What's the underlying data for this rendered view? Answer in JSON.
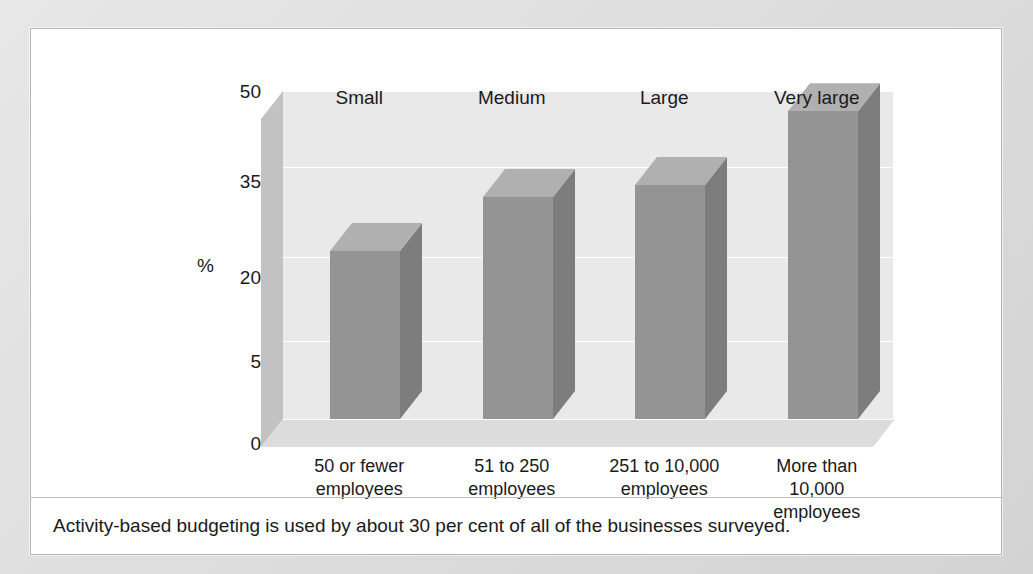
{
  "clipped_top_text": "",
  "chart_data": {
    "type": "bar",
    "title": "",
    "xlabel": "",
    "ylabel": "%",
    "categories": [
      "50 or fewer\nemployees",
      "51 to 250\nemployees",
      "251 to 10,000\nemployees",
      "More than\n10,000\nemployees"
    ],
    "group_labels": [
      "Small",
      "Medium",
      "Large",
      "Very large"
    ],
    "values": [
      21,
      30,
      32,
      46
    ],
    "ytick_labels": [
      "50",
      "35",
      "20",
      "5",
      "0"
    ],
    "ytick_values": [
      50,
      35,
      20,
      5,
      0
    ],
    "ylim": [
      0,
      50
    ],
    "grid": true,
    "legend": "none",
    "style": "3d-column",
    "colors": {
      "bar_front": "#949494",
      "bar_side": "#7d7d7d",
      "bar_top": "#b0b0b0",
      "back_wall": "#e9e9e9",
      "left_wall": "#c2c2c2",
      "floor": "#dcdcdc",
      "panel": "#ffffff",
      "page": "#dadada",
      "text": "#1a1a1a"
    }
  },
  "ticks": [
    {
      "label": "50",
      "top": 52
    },
    {
      "label": "35",
      "top": 142
    },
    {
      "label": "20",
      "top": 238
    },
    {
      "label": "5",
      "top": 322
    },
    {
      "label": "0",
      "top": 404
    }
  ],
  "axis": {
    "percent_symbol": "%"
  },
  "bars": [
    {
      "group": "Small",
      "value": 21,
      "category_line1": "50 or fewer",
      "category_line2": "employees",
      "category_line3": ""
    },
    {
      "group": "Medium",
      "value": 30,
      "category_line1": "51 to 250",
      "category_line2": "employees",
      "category_line3": ""
    },
    {
      "group": "Large",
      "value": 32,
      "category_line1": "251 to 10,000",
      "category_line2": "employees",
      "category_line3": ""
    },
    {
      "group": "Very large",
      "value": 46,
      "category_line1": "More than",
      "category_line2": "10,000",
      "category_line3": "employees"
    }
  ],
  "caption": {
    "text": "Activity-based budgeting is used by about 30 per cent of all of the businesses surveyed."
  }
}
